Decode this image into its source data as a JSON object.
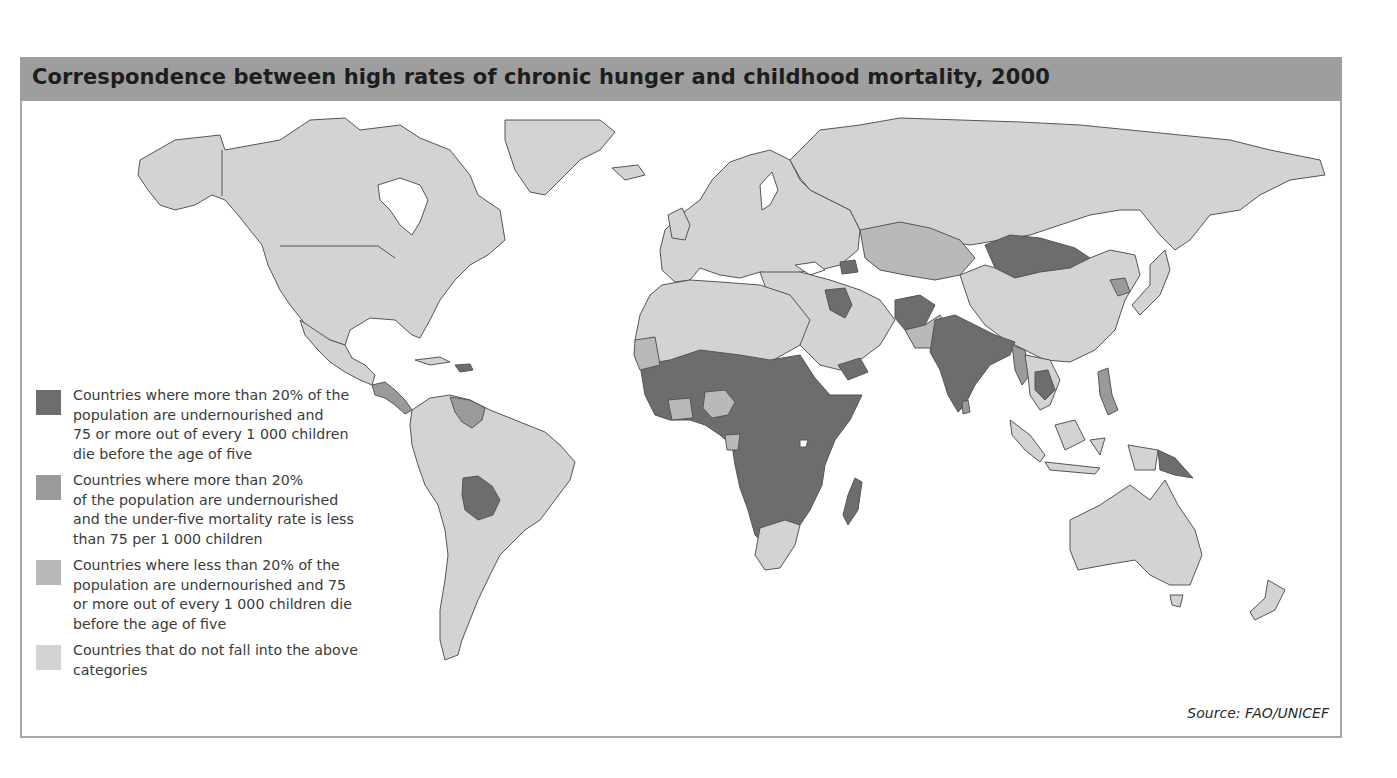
{
  "title": "Correspondence between high rates of chronic hunger and childhood mortality, 2000",
  "colors": {
    "header_bg": "#9e9e9e",
    "frame_border": "#a8a8a8",
    "cat_high_hunger_high_mortality": "#6d6d6d",
    "cat_high_hunger_low_mortality": "#9a9a9a",
    "cat_low_hunger_high_mortality": "#b9b9b9",
    "cat_other": "#d3d3d3",
    "ocean": "#ffffff",
    "border_line": "#555555"
  },
  "legend": {
    "items": [
      {
        "label": "Countries where more than 20% of the\npopulation are undernourished and\n75 or more out of every 1 000 children\ndie before the age of five",
        "color": "#6d6d6d"
      },
      {
        "label": "Countries where more than 20%\nof the population are undernourished\nand the under-five mortality rate is less\nthan 75 per 1 000 children",
        "color": "#9a9a9a"
      },
      {
        "label": "Countries where less than 20% of the\npopulation are undernourished and 75\nor more out of every 1 000 children die\nbefore the age of five",
        "color": "#b9b9b9"
      },
      {
        "label": "Countries that do not fall into the above\ncategories",
        "color": "#d3d3d3"
      }
    ]
  },
  "source": "Source: FAO/UNICEF",
  "map": {
    "regions_category_1": [
      "Sub-Saharan Africa (most)",
      "Bolivia",
      "Haiti",
      "India",
      "Bangladesh",
      "Afghanistan",
      "Mongolia",
      "Iraq",
      "Yemen",
      "Cambodia",
      "Laos",
      "Papua New Guinea",
      "Madagascar",
      "Armenia/Azerbaijan"
    ],
    "regions_category_2": [
      "Venezuela",
      "Central America (parts)",
      "Kazakhstan region",
      "North Korea",
      "Myanmar",
      "Sri Lanka",
      "Philippines",
      "Thailand"
    ],
    "regions_category_3": [
      "Nigeria",
      "Ghana",
      "Gabon",
      "Mauritania",
      "South Africa region (parts)"
    ],
    "regions_other": [
      "North America",
      "Europe",
      "Russia",
      "China",
      "Australia",
      "Most of South America",
      "North Africa",
      "Middle East (most)"
    ]
  }
}
